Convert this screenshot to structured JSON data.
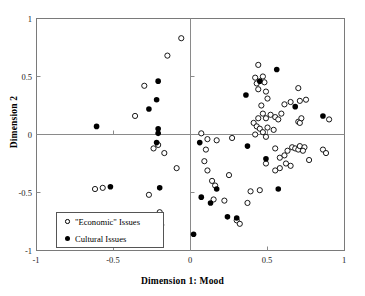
{
  "chart_data": {
    "type": "scatter",
    "title": "",
    "xlabel": "Dimension 1: Mood",
    "ylabel": "Dimension 2",
    "xlim": [
      -1,
      1
    ],
    "ylim": [
      -1,
      1
    ],
    "xticks": [
      -1,
      -0.5,
      0,
      0.5,
      1
    ],
    "yticks": [
      -1,
      -0.5,
      0,
      0.5,
      1
    ],
    "xtick_labels": [
      "-1",
      "-0.5",
      "0",
      "0.5",
      "1"
    ],
    "ytick_labels": [
      "-1",
      "-0.5",
      "0",
      "0.5",
      "1"
    ],
    "grid": false,
    "zero_lines": true,
    "legend_position": "lower-left-inside",
    "series": [
      {
        "name": "\"Economic\" Issues",
        "marker": "open-circle",
        "color": "#000000",
        "points": [
          [
            -0.06,
            0.83
          ],
          [
            -0.15,
            0.68
          ],
          [
            -0.3,
            0.42
          ],
          [
            -0.36,
            0.16
          ],
          [
            -0.21,
            -0.09
          ],
          [
            -0.24,
            -0.12
          ],
          [
            -0.17,
            -0.16
          ],
          [
            -0.09,
            -0.29
          ],
          [
            -0.62,
            -0.47
          ],
          [
            -0.57,
            -0.46
          ],
          [
            -0.27,
            -0.52
          ],
          [
            -0.25,
            -0.73
          ],
          [
            -0.19,
            -0.78
          ],
          [
            -0.2,
            -0.67
          ],
          [
            0.07,
            0.01
          ],
          [
            0.11,
            -0.04
          ],
          [
            0.17,
            -0.05
          ],
          [
            0.27,
            -0.03
          ],
          [
            0.1,
            -0.13
          ],
          [
            0.09,
            -0.23
          ],
          [
            0.11,
            -0.31
          ],
          [
            0.14,
            -0.4
          ],
          [
            0.16,
            -0.44
          ],
          [
            0.15,
            -0.56
          ],
          [
            0.22,
            -0.57
          ],
          [
            0.25,
            -0.35
          ],
          [
            0.3,
            -0.74
          ],
          [
            0.32,
            -0.77
          ],
          [
            0.37,
            -0.59
          ],
          [
            0.39,
            -0.49
          ],
          [
            0.44,
            0.6
          ],
          [
            0.42,
            0.49
          ],
          [
            0.47,
            0.5
          ],
          [
            0.43,
            0.44
          ],
          [
            0.44,
            0.39
          ],
          [
            0.48,
            0.45
          ],
          [
            0.49,
            0.37
          ],
          [
            0.5,
            0.31
          ],
          [
            0.46,
            0.25
          ],
          [
            0.47,
            0.18
          ],
          [
            0.44,
            0.14
          ],
          [
            0.49,
            0.14
          ],
          [
            0.52,
            0.17
          ],
          [
            0.55,
            0.15
          ],
          [
            0.57,
            0.13
          ],
          [
            0.59,
            0.18
          ],
          [
            0.41,
            0.1
          ],
          [
            0.43,
            0.07
          ],
          [
            0.45,
            0.05
          ],
          [
            0.47,
            0.02
          ],
          [
            0.5,
            0.06
          ],
          [
            0.54,
            0.04
          ],
          [
            0.42,
            0.0
          ],
          [
            0.49,
            -0.02
          ],
          [
            0.61,
            0.26
          ],
          [
            0.65,
            0.28
          ],
          [
            0.7,
            0.4
          ],
          [
            0.71,
            0.29
          ],
          [
            0.75,
            0.3
          ],
          [
            0.7,
            0.11
          ],
          [
            0.71,
            0.1
          ],
          [
            0.72,
            0.14
          ],
          [
            0.9,
            0.13
          ],
          [
            0.55,
            -0.12
          ],
          [
            0.58,
            -0.2
          ],
          [
            0.61,
            -0.18
          ],
          [
            0.63,
            -0.14
          ],
          [
            0.66,
            -0.11
          ],
          [
            0.68,
            -0.12
          ],
          [
            0.7,
            -0.13
          ],
          [
            0.71,
            -0.1
          ],
          [
            0.74,
            -0.11
          ],
          [
            0.73,
            -0.14
          ],
          [
            0.77,
            -0.22
          ],
          [
            0.86,
            -0.13
          ],
          [
            0.88,
            -0.16
          ],
          [
            0.62,
            -0.25
          ],
          [
            0.65,
            -0.27
          ],
          [
            0.55,
            -0.31
          ],
          [
            0.58,
            -0.29
          ],
          [
            0.49,
            -0.25
          ],
          [
            0.45,
            -0.48
          ]
        ]
      },
      {
        "name": "Cultural Issues",
        "marker": "filled-circle",
        "color": "#000000",
        "points": [
          [
            -0.21,
            0.46
          ],
          [
            -0.22,
            0.3
          ],
          [
            -0.27,
            0.22
          ],
          [
            -0.61,
            0.07
          ],
          [
            -0.21,
            0.05
          ],
          [
            -0.21,
            0.01
          ],
          [
            -0.22,
            -0.07
          ],
          [
            -0.52,
            -0.45
          ],
          [
            -0.2,
            -0.46
          ],
          [
            0.06,
            -0.07
          ],
          [
            0.07,
            -0.54
          ],
          [
            0.13,
            -0.59
          ],
          [
            0.17,
            -0.47
          ],
          [
            0.02,
            -0.86
          ],
          [
            0.24,
            -0.71
          ],
          [
            0.3,
            -0.72
          ],
          [
            0.36,
            0.34
          ],
          [
            0.37,
            -0.1
          ],
          [
            0.45,
            0.46
          ],
          [
            0.56,
            0.56
          ],
          [
            0.49,
            -0.21
          ],
          [
            0.57,
            -0.47
          ],
          [
            0.68,
            0.24
          ],
          [
            0.86,
            0.16
          ]
        ]
      }
    ]
  },
  "legend": {
    "items": [
      {
        "label": "\"Economic\" Issues",
        "marker": "open-circle"
      },
      {
        "label": "Cultural Issues",
        "marker": "filled-circle"
      }
    ]
  },
  "axes": {
    "x_title": "Dimension 1: Mood",
    "y_title": "Dimension 2",
    "x_labels": [
      "-1",
      "-0.5",
      "0",
      "0.5",
      "1"
    ],
    "y_labels": [
      "1",
      "0.5",
      "0",
      "-0.5",
      "-1"
    ]
  }
}
